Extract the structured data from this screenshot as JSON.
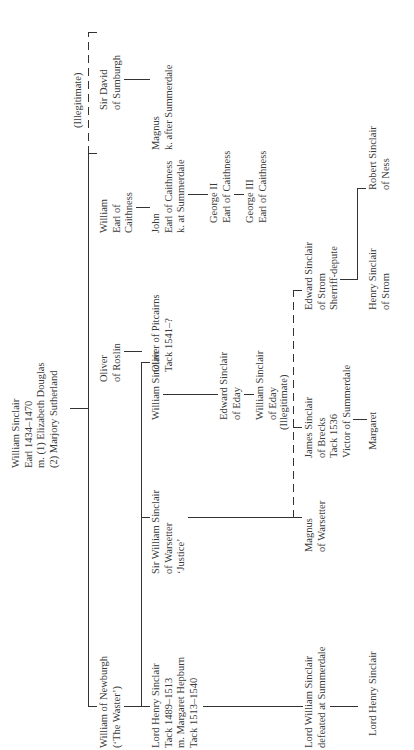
{
  "tree": {
    "root": {
      "lines": [
        "William Sinclair",
        "Earl 1434–1470",
        "m. (1) Elizabeth Douglas",
        "     (2) Marjory Sutherland"
      ]
    },
    "gen1": [
      {
        "id": "william_newburgh",
        "lines": [
          "William of Newburgh",
          "(‘The Waster’)"
        ]
      },
      {
        "id": "oliver_roslin",
        "lines": [
          "Oliver",
          "of Roslin"
        ]
      },
      {
        "id": "william_caithness",
        "lines": [
          "William",
          "Earl of",
          "Caithness"
        ]
      },
      {
        "id": "david_sumburgh",
        "lines": [
          "Sir David",
          "of Sumburgh"
        ]
      }
    ],
    "illegitimate_label_1": "(Illegitimate)",
    "gen2": [
      {
        "id": "henry_sinclair",
        "lines": [
          "Lord Henry Sinclair",
          "Tack 1489–1513",
          "m. Margaret Hepburn",
          "Tack 1513–1540"
        ]
      },
      {
        "id": "william_warsetter",
        "lines": [
          "Sir William Sinclair",
          "of Warsetter",
          "‘Justice’"
        ]
      },
      {
        "id": "william_sinclair_roslin",
        "lines": [
          "William Sinclair"
        ]
      },
      {
        "id": "oliver_pitcairns",
        "lines": [
          "Oliver of Pitcairns",
          "Tack 1541–?"
        ]
      },
      {
        "id": "john_caithness",
        "lines": [
          "John",
          "Earl of Caithness",
          "k. at Summerdale"
        ]
      },
      {
        "id": "magnus_sumburgh",
        "lines": [
          "Magnus",
          "k. after Summerdale"
        ]
      }
    ],
    "gen3": [
      {
        "id": "edward_eday",
        "lines": [
          "Edward Sinclair",
          "of Eday"
        ]
      },
      {
        "id": "george_ii",
        "lines": [
          "George II",
          "Earl of Caithness"
        ]
      }
    ],
    "gen4": [
      {
        "id": "william_eday",
        "lines": [
          "William Sinclair",
          "of Eday"
        ]
      },
      {
        "id": "george_iii",
        "lines": [
          "George III",
          "Earl of Caithness"
        ]
      }
    ],
    "illegitimate_label_2": "(Illegitimate)",
    "warsetter_children": [
      {
        "id": "magnus_warsetter",
        "lines": [
          "Magnus",
          "of Warsetter"
        ]
      },
      {
        "id": "james_brecks",
        "lines": [
          "James Sinclair",
          "of Brecks",
          "Tack 1536",
          "Victor of Summerdale"
        ]
      },
      {
        "id": "edward_strom",
        "lines": [
          "Edward Sinclair",
          "of Strom",
          "Sherriff-depute"
        ]
      }
    ],
    "henry_child": {
      "id": "william_lord",
      "lines": [
        "Lord William Sinclair",
        "defeated at Summerdale"
      ]
    },
    "william_lord_child": {
      "id": "henry_lord_2",
      "lines": [
        "Lord Henry Sinclair"
      ]
    },
    "james_child": {
      "id": "margaret",
      "lines": [
        "Margaret"
      ]
    },
    "edward_strom_children": [
      {
        "id": "henry_strom",
        "lines": [
          "Henry Sinclair",
          "of Strom"
        ]
      },
      {
        "id": "robert_ness",
        "lines": [
          "Robert Sinclair",
          "of Ness"
        ]
      }
    ]
  }
}
